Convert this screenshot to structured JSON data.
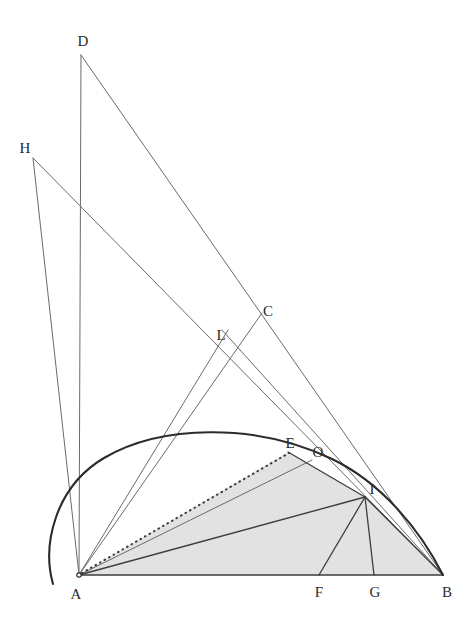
{
  "figure": {
    "background_color": "#ffffff",
    "stroke_color": "#555555",
    "heavy_stroke_color": "#2b2b2b",
    "shade_fill_color": "#e2e2e2",
    "label_color": "#2b2b2b",
    "width": 473,
    "height": 619
  },
  "points": [
    {
      "name": "A",
      "label": "A",
      "x": 79,
      "y": 575,
      "label_x": 76,
      "label_y": 594
    },
    {
      "name": "B",
      "label": "B",
      "x": 443,
      "y": 575,
      "label_x": 447,
      "label_y": 592
    },
    {
      "name": "C",
      "label": "C",
      "x": 262,
      "y": 313,
      "label_x": 268,
      "label_y": 311
    },
    {
      "name": "D",
      "label": "D",
      "x": 81,
      "y": 55,
      "label_x": 83,
      "label_y": 41
    },
    {
      "name": "E",
      "label": "E",
      "x": 288,
      "y": 452,
      "label_x": 290,
      "label_y": 443
    },
    {
      "name": "F",
      "label": "F",
      "x": 319,
      "y": 575,
      "label_x": 319,
      "label_y": 592
    },
    {
      "name": "G",
      "label": "G",
      "x": 374,
      "y": 575,
      "label_x": 375,
      "label_y": 592
    },
    {
      "name": "H",
      "label": "H",
      "x": 33,
      "y": 158,
      "label_x": 25,
      "label_y": 148
    },
    {
      "name": "I",
      "label": "I",
      "x": 365,
      "y": 497,
      "label_x": 372,
      "label_y": 489
    },
    {
      "name": "L",
      "label": "L",
      "x": 232,
      "y": 362,
      "label_x": 221,
      "label_y": 335
    },
    {
      "name": "O",
      "label": "O",
      "x": 312,
      "y": 460,
      "label_x": 318,
      "label_y": 452
    }
  ],
  "arc": {
    "name": "elliptical-arc-AB",
    "path": "M 53 584 C 42 545 55 487 104 458 C 160 425 255 422 332 459 C 382 483 420 530 443 575",
    "stroke_width": 2.1,
    "stroke": "#2b2b2b"
  },
  "shaded_region": {
    "name": "region-A-E-I-B",
    "path": "M 79 575 L 288 452 L 365 497 L 443 575 Z",
    "fill": "#e2e2e2"
  },
  "segments": [
    {
      "name": "segment-A-B",
      "from": "A",
      "to": "B",
      "style": "heavy",
      "stroke_width": 1.6
    },
    {
      "name": "segment-A-D",
      "from": "A",
      "to": "D",
      "style": "thin",
      "stroke_width": 1.0
    },
    {
      "name": "segment-A-H",
      "from": "A",
      "to": "H",
      "style": "thin",
      "stroke_width": 1.0
    },
    {
      "name": "segment-D-B",
      "from": "D",
      "to": "B",
      "style": "thin",
      "stroke_width": 1.0
    },
    {
      "name": "segment-H-B",
      "from": "H",
      "to": "B",
      "style": "thin",
      "stroke_width": 1.0
    },
    {
      "name": "segment-A-C",
      "from": "A",
      "to": "C",
      "style": "thin",
      "stroke_width": 1.0
    },
    {
      "name": "segment-A-L",
      "from": "A",
      "to": "L",
      "style": "thin",
      "stroke_width": 1.0
    },
    {
      "name": "segment-A-I",
      "from": "A",
      "to": "I",
      "style": "medium",
      "stroke_width": 1.4
    },
    {
      "name": "segment-A-E-dotted",
      "from": "A",
      "to": "E",
      "style": "dotted",
      "stroke_width": 2.0
    },
    {
      "name": "segment-E-I",
      "from": "E",
      "to": "I",
      "style": "medium",
      "stroke_width": 1.3
    },
    {
      "name": "segment-A-O-through-E",
      "from": "A",
      "to": "O",
      "style": "thin",
      "stroke_width": 1.0
    },
    {
      "name": "segment-I-F",
      "from": "I",
      "to": "F",
      "style": "medium",
      "stroke_width": 1.3
    },
    {
      "name": "segment-I-G",
      "from": "I",
      "to": "G",
      "style": "medium",
      "stroke_width": 1.3
    },
    {
      "name": "segment-I-B",
      "from": "I",
      "to": "B",
      "style": "medium",
      "stroke_width": 1.3
    },
    {
      "name": "segment-L-through-C-down",
      "from": "L",
      "to": "B",
      "style": "thin",
      "stroke_width": 1.0
    }
  ],
  "legend": {
    "point_names": [
      "A",
      "B",
      "C",
      "D",
      "E",
      "F",
      "G",
      "H",
      "I",
      "L",
      "O"
    ]
  }
}
